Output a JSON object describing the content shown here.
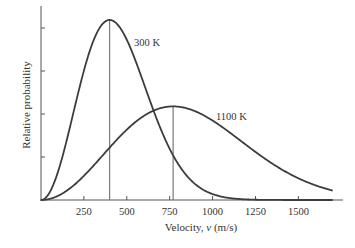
{
  "chart_data": {
    "type": "line",
    "title": "",
    "xlabel": "Velocity, v (m/s)",
    "xlabel_prefix": "Velocity, ",
    "xlabel_var": "v",
    "xlabel_suffix": " (m/s)",
    "ylabel": "Relative probability",
    "xlim": [
      0,
      1760
    ],
    "ylim": [
      0,
      1.1
    ],
    "xticks": [
      250,
      500,
      750,
      1000,
      1250,
      1500
    ],
    "xtick_labels": [
      "250",
      "500",
      "750",
      "1000",
      "1250",
      "1500"
    ],
    "yticks": [
      0.25,
      0.5,
      0.75,
      1.0
    ],
    "ytick_labels": [
      "",
      "",
      "",
      ""
    ],
    "grid": false,
    "legend": "none",
    "series": [
      {
        "name": "300 K",
        "label": "300 K",
        "temperature_K": 300,
        "most_probable_velocity": 400,
        "peak_value": 1.0,
        "x_range": [
          0,
          1700
        ],
        "color": "#3d3d3d",
        "marker_line_color": "#7a7a7a"
      },
      {
        "name": "1100 K",
        "label": "1100 K",
        "temperature_K": 1100,
        "most_probable_velocity": 770,
        "peak_value": 0.52,
        "x_range": [
          0,
          1700
        ],
        "color": "#3d3d3d",
        "marker_line_color": "#7a7a7a"
      }
    ],
    "annotations": [
      {
        "text": "300 K",
        "series": "300 K"
      },
      {
        "text": "1100 K",
        "series": "1100 K"
      }
    ]
  }
}
